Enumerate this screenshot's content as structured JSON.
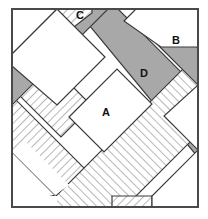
{
  "figure": {
    "canvas": {
      "width": 208,
      "height": 219
    },
    "colors": {
      "background": "#ffffff",
      "gray_band": "#a8a8a8",
      "hatch_line": "#9a9a9a",
      "hatch_background": "#ffffff",
      "outline": "#3a3a3a",
      "frame": "#4a4a4a",
      "label_text": "#111111"
    },
    "frame": {
      "x": 11,
      "y": 8,
      "width": 188,
      "height": 200,
      "stroke_width": 2
    },
    "labels": [
      {
        "id": "A",
        "text": "A",
        "x": 106,
        "y": 113
      },
      {
        "id": "B",
        "text": "B",
        "x": 176,
        "y": 41
      },
      {
        "id": "C",
        "text": "C",
        "x": 80,
        "y": 16
      },
      {
        "id": "D",
        "text": "D",
        "x": 144,
        "y": 74
      }
    ],
    "bands": {
      "direction_1": {
        "name": "ne-sw-bands",
        "description": "Bands running from lower-left to upper-right",
        "count": 3,
        "members": [
          {
            "id": "ne-gray-1",
            "fill": "gray"
          },
          {
            "id": "ne-hatch-1",
            "fill": "hatch"
          },
          {
            "id": "ne-gray-2",
            "fill": "gray"
          }
        ]
      },
      "direction_2": {
        "name": "nw-se-bands",
        "description": "Bands running from upper-left to lower-right",
        "count": 3,
        "members": [
          {
            "id": "nw-hatch-1",
            "fill": "hatch"
          },
          {
            "id": "nw-gray-1",
            "fill": "gray"
          },
          {
            "id": "nw-hatch-2",
            "fill": "hatch"
          }
        ]
      }
    },
    "regions": {
      "A": "central white quadrilateral opening",
      "B": "upper-right white region",
      "C": "small hatched strip at top edge",
      "D": "hatched band running upper-left to lower-right"
    }
  }
}
